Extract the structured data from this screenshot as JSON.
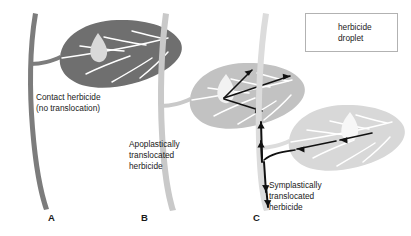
{
  "figure": {
    "background_color": "#ffffff",
    "panels": [
      {
        "id": "A",
        "caption": "A",
        "label": "Contact herbicide\n(no translocation)",
        "mode": "contact",
        "stem_color": "#7c7c7c",
        "leaf_color": "#6f6f6f",
        "vein_color": "#ffffff",
        "droplet_color": "#d9d9d9",
        "arrow_count": 0
      },
      {
        "id": "B",
        "caption": "B",
        "label": "Apoplastically\ntranslocated\nherbicide",
        "mode": "apoplastic",
        "stem_color": "#c9c9c9",
        "leaf_color": "#c2c2c2",
        "vein_color": "#ffffff",
        "droplet_color": "#f2f2f2",
        "arrow_count": 3
      },
      {
        "id": "C",
        "caption": "C",
        "label": "Symplastically\ntranslocated\nherbicide",
        "mode": "symplastic",
        "stem_color": "#dcdcdc",
        "leaf_color": "#d8d8d8",
        "vein_color": "#ffffff",
        "droplet_color": "#f7f7f7",
        "arrow_count": 5
      }
    ]
  },
  "legend": {
    "text": "herbicide\ndroplet",
    "droplet_color": "#8f8f8f",
    "border_color": "#b2b2b2",
    "background_color": "#ffffff"
  },
  "style": {
    "arrow_color": "#111111",
    "text_color": "#1a1a1a"
  }
}
